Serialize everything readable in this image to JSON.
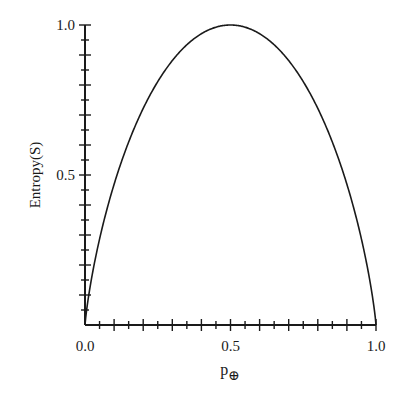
{
  "chart_data": {
    "type": "line",
    "title": "",
    "xlabel": "p⊕",
    "xlabel_main": "p",
    "xlabel_subscript": "⊕",
    "ylabel": "Entropy(S)",
    "xlim": [
      0.0,
      1.0
    ],
    "ylim": [
      0.0,
      1.0
    ],
    "x_tick_labels": [
      "0.0",
      "0.5",
      "1.0"
    ],
    "y_tick_labels": [
      "0.5",
      "1.0"
    ],
    "x_minor_tick_step": 0.05,
    "y_minor_tick_step": 0.05,
    "grid": false,
    "legend": null,
    "series": [
      {
        "name": "Entropy",
        "function": "-p*log2(p) - (1-p)*log2(1-p)",
        "x": [
          0.0,
          0.05,
          0.1,
          0.15,
          0.2,
          0.25,
          0.3,
          0.35,
          0.4,
          0.45,
          0.5,
          0.55,
          0.6,
          0.65,
          0.7,
          0.75,
          0.8,
          0.85,
          0.9,
          0.95,
          1.0
        ],
        "values": [
          0.0,
          0.286,
          0.469,
          0.61,
          0.722,
          0.811,
          0.881,
          0.934,
          0.971,
          0.993,
          1.0,
          0.993,
          0.971,
          0.934,
          0.881,
          0.811,
          0.722,
          0.61,
          0.469,
          0.286,
          0.0
        ]
      }
    ],
    "colors": {
      "line": "#1a1a1a",
      "axis": "#1a1a1a",
      "background": "#ffffff"
    }
  }
}
